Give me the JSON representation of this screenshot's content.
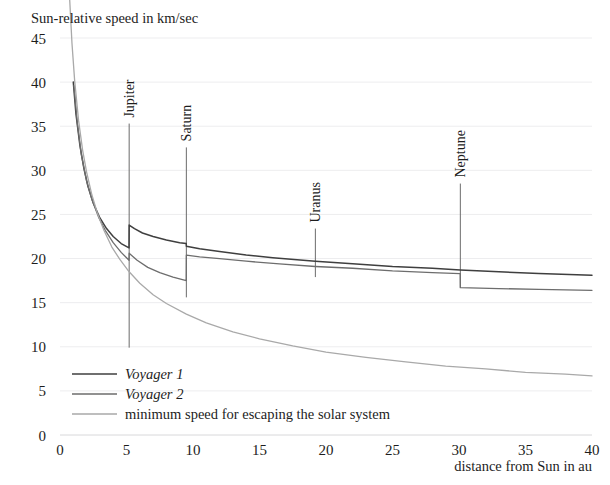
{
  "chart_data": {
    "type": "line",
    "title": "",
    "ylabel": "Sun-relative speed in km/sec",
    "xlabel": "distance from Sun in au",
    "xlim": [
      0,
      40
    ],
    "ylim": [
      0,
      45
    ],
    "xticks": [
      0,
      5,
      10,
      15,
      20,
      25,
      30,
      35,
      40
    ],
    "yticks": [
      0,
      5,
      10,
      15,
      20,
      25,
      30,
      35,
      40,
      45
    ],
    "grid": true,
    "legend_position": "inside-lower-left",
    "annotations": [
      {
        "label": "Jupiter",
        "x": 5.2,
        "top": 35.3,
        "bottom": 9.9
      },
      {
        "label": "Saturn",
        "x": 9.5,
        "top": 32.6,
        "bottom": 15.6
      },
      {
        "label": "Uranus",
        "x": 19.2,
        "top": 23.4,
        "bottom": 17.9
      },
      {
        "label": "Neptune",
        "x": 30.1,
        "top": 28.5,
        "bottom": 16.7
      }
    ],
    "series": [
      {
        "name": "Voyager 1",
        "color": "#3f3f3f",
        "points": [
          [
            1.0,
            40.0
          ],
          [
            1.2,
            36.4
          ],
          [
            1.5,
            32.8
          ],
          [
            1.8,
            30.2
          ],
          [
            2.1,
            28.2
          ],
          [
            2.5,
            26.3
          ],
          [
            3.0,
            24.6
          ],
          [
            3.5,
            23.4
          ],
          [
            4.0,
            22.5
          ],
          [
            4.6,
            21.7
          ],
          [
            5.19,
            21.2
          ],
          [
            5.2,
            23.8
          ],
          [
            5.6,
            23.4
          ],
          [
            6.2,
            22.9
          ],
          [
            7.0,
            22.5
          ],
          [
            8.0,
            22.1
          ],
          [
            9.0,
            21.8
          ],
          [
            9.49,
            21.7
          ],
          [
            9.5,
            21.4
          ],
          [
            10.5,
            21.1
          ],
          [
            12.0,
            20.8
          ],
          [
            14.0,
            20.4
          ],
          [
            16.0,
            20.1
          ],
          [
            19.2,
            19.7
          ],
          [
            22.0,
            19.4
          ],
          [
            25.0,
            19.1
          ],
          [
            28.0,
            18.9
          ],
          [
            30.1,
            18.7
          ],
          [
            33.0,
            18.5
          ],
          [
            36.0,
            18.3
          ],
          [
            40.0,
            18.1
          ]
        ]
      },
      {
        "name": "Voyager 2",
        "color": "#6d6d6d",
        "points": [
          [
            1.05,
            39.6
          ],
          [
            1.3,
            35.4
          ],
          [
            1.6,
            31.8
          ],
          [
            2.0,
            28.8
          ],
          [
            2.4,
            26.7
          ],
          [
            2.9,
            24.7
          ],
          [
            3.4,
            23.2
          ],
          [
            4.0,
            21.8
          ],
          [
            4.6,
            20.7
          ],
          [
            5.19,
            19.8
          ],
          [
            5.2,
            20.6
          ],
          [
            5.8,
            19.8
          ],
          [
            6.6,
            19.0
          ],
          [
            7.5,
            18.4
          ],
          [
            8.5,
            17.9
          ],
          [
            9.49,
            17.5
          ],
          [
            9.5,
            20.4
          ],
          [
            10.5,
            20.2
          ],
          [
            12.0,
            20.0
          ],
          [
            14.0,
            19.7
          ],
          [
            16.5,
            19.4
          ],
          [
            19.19,
            19.1
          ],
          [
            19.2,
            19.1
          ],
          [
            22.0,
            18.9
          ],
          [
            25.0,
            18.6
          ],
          [
            28.0,
            18.4
          ],
          [
            30.09,
            18.3
          ],
          [
            30.1,
            16.7
          ],
          [
            33.0,
            16.6
          ],
          [
            36.0,
            16.5
          ],
          [
            40.0,
            16.4
          ]
        ]
      },
      {
        "name": "minimum speed for escaping the solar system",
        "color": "#a9a9a9",
        "points": [
          [
            0.72,
            49.6
          ],
          [
            0.9,
            44.4
          ],
          [
            1.1,
            40.2
          ],
          [
            1.4,
            35.6
          ],
          [
            1.7,
            32.3
          ],
          [
            2.0,
            29.8
          ],
          [
            2.4,
            27.2
          ],
          [
            2.8,
            25.2
          ],
          [
            3.3,
            23.2
          ],
          [
            3.9,
            21.3
          ],
          [
            4.5,
            19.9
          ],
          [
            5.2,
            18.5
          ],
          [
            6.0,
            17.2
          ],
          [
            7.0,
            15.9
          ],
          [
            8.0,
            14.9
          ],
          [
            9.5,
            13.7
          ],
          [
            11.0,
            12.7
          ],
          [
            13.0,
            11.7
          ],
          [
            15.0,
            10.9
          ],
          [
            17.5,
            10.1
          ],
          [
            20.0,
            9.4
          ],
          [
            23.0,
            8.8
          ],
          [
            26.0,
            8.3
          ],
          [
            29.0,
            7.8
          ],
          [
            32.0,
            7.5
          ],
          [
            35.0,
            7.1
          ],
          [
            38.0,
            6.9
          ],
          [
            40.0,
            6.7
          ]
        ]
      }
    ],
    "legend_entries": [
      {
        "label": "Voyager 1",
        "color": "#3f3f3f",
        "italic": true
      },
      {
        "label": "Voyager 2",
        "color": "#6d6d6d",
        "italic": true
      },
      {
        "label": "minimum speed for escaping the solar system",
        "color": "#a9a9a9",
        "italic": false
      }
    ]
  }
}
